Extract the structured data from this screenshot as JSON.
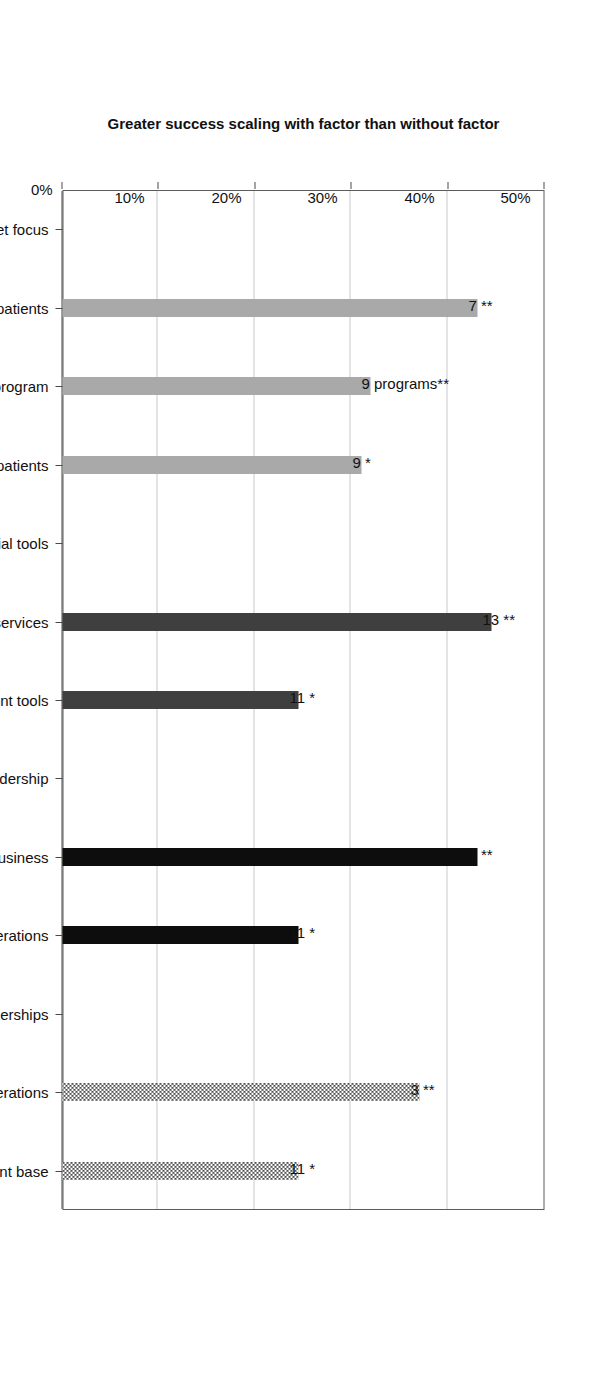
{
  "chart_data": {
    "type": "bar",
    "orientation": "horizontal-rotated",
    "title": "",
    "xlabel": "",
    "ylabel": "Greater success scaling with factor than without factor",
    "ylim": [
      0,
      50
    ],
    "grid": true,
    "legend": "none",
    "tick_labels": [
      "0%",
      "10%",
      "20%",
      "30%",
      "40%",
      "50%"
    ],
    "tick_values": [
      0,
      10,
      20,
      30,
      40,
      50
    ],
    "categories": [
      "A. Market focus",
      "A1. Emphasize branding to attract patients",
      "A2. Health education to promote program",
      "A3. Emphasize quality experience for patients",
      "B. Financial tools",
      "B1. Revenue beyond patient services",
      "B2. Alternative payment tools",
      "C. Administration & leadership",
      "C1. Leader is a physician with a business",
      "C2. Standardize non-clinical operations",
      "D. Partnerships",
      "D1. Franchise operations",
      "D2. Partners providing  access to a client base"
    ],
    "values": [
      null,
      43.0,
      32.0,
      31.0,
      null,
      44.5,
      24.5,
      null,
      43.0,
      24.5,
      null,
      37.0,
      24.5
    ],
    "data_labels": [
      null,
      "7 **",
      "9 programs**",
      "9 *",
      null,
      "13 **",
      "11 *",
      null,
      "7 **",
      "11 *",
      null,
      "3 **",
      "11 *"
    ],
    "bar_styles": [
      null,
      "solid-light",
      "solid-light",
      "solid-light",
      null,
      "solid-dark",
      "solid-dark",
      null,
      "solid-black",
      "solid-black",
      null,
      "checker",
      "checker"
    ],
    "group_headers": [
      "A. Market focus",
      "B. Financial tools",
      "C. Administration & leadership",
      "D. Partnerships"
    ],
    "colors": {
      "group_a": "#a9a9a9",
      "group_b": "#3f3f3f",
      "group_c": "#0d0d0d",
      "group_d_pattern": "#4f4f4f",
      "grid": "#c9c9c9",
      "axis": "#4a4a4a",
      "background": "#ffffff"
    }
  },
  "axis": {
    "value_axis_title": "Greater success scaling with factor than without factor"
  }
}
